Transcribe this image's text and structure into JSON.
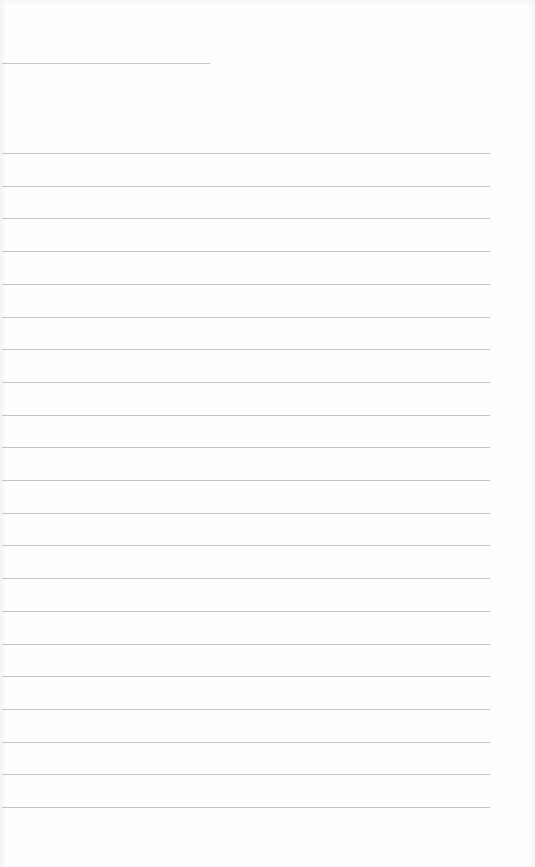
{
  "document": {
    "type": "lined-paper",
    "background_color": "#fefefe",
    "line_color": "#c4c4c4"
  },
  "header_line": {
    "x": 2,
    "y": 63,
    "width": 208
  },
  "ruled_lines": {
    "count": 21,
    "x": 2,
    "width": 488,
    "first_y": 153,
    "spacing": 32.7
  }
}
